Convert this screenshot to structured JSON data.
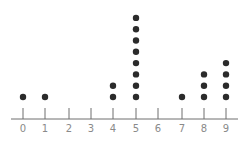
{
  "chart_data": {
    "type": "dot",
    "title": "",
    "xlabel": "",
    "ylabel": "",
    "categories": [
      "0",
      "1",
      "2",
      "3",
      "4",
      "5",
      "6",
      "7",
      "8",
      "9"
    ],
    "values": [
      1,
      1,
      0,
      0,
      2,
      8,
      0,
      1,
      3,
      4
    ],
    "xlim": [
      0,
      9
    ],
    "grid": false,
    "legend": null
  },
  "colors": {
    "dot": "#2b2b2b",
    "axis": "#6e6e6e",
    "label": "#8a8a8a"
  },
  "layout": {
    "tick_x": [
      23,
      45,
      69,
      91,
      113,
      136,
      158,
      182,
      204,
      226
    ],
    "axis_y": 119,
    "axis_x0": 11,
    "axis_x1": 238,
    "tick_top": 108,
    "label_y": 132,
    "dot_base_y": 97,
    "dot_spacing": 11.3,
    "dot_r": 3.2
  }
}
